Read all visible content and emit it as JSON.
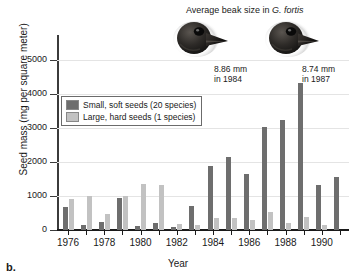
{
  "panel": {
    "label": "b."
  },
  "beak_annotation": {
    "title_prefix": "Average beak size in ",
    "title_italic": "G. fortis",
    "items": [
      {
        "measurement": "8.86 mm",
        "year_line": "in 1984",
        "icon": "finch-head-photo"
      },
      {
        "measurement": "8.74 mm",
        "year_line": "in 1987",
        "icon": "finch-head-photo"
      }
    ]
  },
  "legend": {
    "entries": [
      {
        "label": "Small, soft seeds (20 species)",
        "color": "#6e6e6e",
        "key": "small"
      },
      {
        "label": "Large, hard seeds (1 species)",
        "color": "#c2c2c2",
        "key": "large"
      }
    ]
  },
  "chart_data": {
    "type": "bar",
    "title": "",
    "xlabel": "Year",
    "ylabel": "Seed mass (mg per square meter)",
    "ylim": [
      0,
      5600
    ],
    "yticks": [
      0,
      1000,
      2000,
      3000,
      4000,
      5000
    ],
    "ytick_labels": [
      "0",
      "1000",
      "2000",
      "3000",
      "4000",
      "5000"
    ],
    "xtick_labels": [
      "1976",
      "1978",
      "1980",
      "1982",
      "1984",
      "1986",
      "1988",
      "1990"
    ],
    "categories": [
      1976,
      1977,
      1978,
      1979,
      1980,
      1981,
      1982,
      1983,
      1984,
      1985,
      1986,
      1987,
      1988,
      1989,
      1990,
      1991
    ],
    "grid": "horizontal",
    "legend_position": "upper-left-inside",
    "series": [
      {
        "name": "Small, soft seeds (20 species)",
        "color": "#6e6e6e",
        "values": [
          670,
          160,
          230,
          950,
          120,
          210,
          80,
          700,
          1890,
          2140,
          1660,
          3040,
          3240,
          4330,
          1320,
          1550
        ]
      },
      {
        "name": "Large, hard seeds (1 species)",
        "color": "#c2c2c2",
        "values": [
          920,
          990,
          480,
          990,
          1340,
          1310,
          170,
          160,
          350,
          340,
          300,
          540,
          200,
          380,
          140,
          0
        ]
      }
    ]
  }
}
